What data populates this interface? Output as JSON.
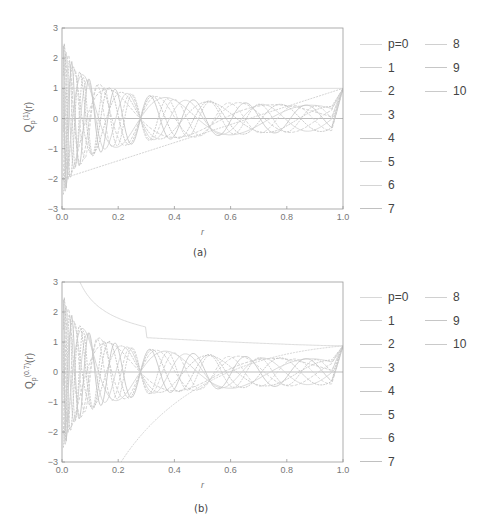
{
  "chart_data": [
    {
      "type": "line",
      "panel": "(a)",
      "title": "",
      "caption": "(a)",
      "xlabel": "r",
      "ylabel": "Q_p^(1)(r)",
      "ylabel_main": "Q",
      "ylabel_sub": "p",
      "ylabel_sup": "(1)",
      "ylabel_arg": "(r)",
      "xlim": [
        0.0,
        1.0
      ],
      "ylim": [
        -3,
        3
      ],
      "xticks": [
        "0.0",
        "0.2",
        "0.4",
        "0.6",
        "0.8",
        "1.0"
      ],
      "yticks": [
        "3",
        "2",
        "1",
        "0",
        "-1",
        "-2",
        "-3"
      ],
      "grid": false,
      "legend_position": "right, two columns",
      "legend": [
        "p=0",
        "1",
        "2",
        "3",
        "4",
        "5",
        "6",
        "7",
        "8",
        "9",
        "10"
      ],
      "alpha": 1,
      "series_description": "Radial functions of order p=0..10; p=0 is constant 1, p=1 rises linearly from about -2 at r=0 to 1 at r=1, higher orders oscillate with decaying amplitude, all reaching 1 at r=1",
      "series": [
        {
          "name": "p=0",
          "x": [
            0.0,
            0.2,
            0.4,
            0.6,
            0.8,
            1.0
          ],
          "values": [
            1.0,
            1.0,
            1.0,
            1.0,
            1.0,
            1.0
          ]
        },
        {
          "name": "1",
          "x": [
            0.0,
            0.2,
            0.4,
            0.6,
            0.8,
            1.0
          ],
          "values": [
            -2.0,
            -1.4,
            -0.8,
            -0.2,
            0.4,
            1.0
          ]
        },
        {
          "name": "2",
          "x": [
            0.0,
            0.2,
            0.4,
            0.6,
            0.8,
            1.0
          ],
          "values": [
            3.0,
            -0.2,
            -0.5,
            -0.5,
            0.0,
            1.0
          ]
        },
        {
          "name": "3",
          "x": [
            0.0,
            0.2,
            0.4,
            0.6,
            0.8,
            1.0
          ],
          "values": [
            -3.0,
            0.7,
            0.1,
            -0.4,
            -0.3,
            1.0
          ]
        },
        {
          "name": "4",
          "x": [
            0.0,
            0.2,
            0.4,
            0.6,
            0.8,
            1.0
          ],
          "values": [
            3.0,
            0.5,
            -0.4,
            0.2,
            -0.3,
            1.0
          ]
        },
        {
          "name": "5",
          "x": [
            0.0,
            0.2,
            0.4,
            0.6,
            0.8,
            1.0
          ],
          "values": [
            -3.0,
            -0.2,
            0.5,
            -0.3,
            0.2,
            1.0
          ]
        },
        {
          "name": "6",
          "x": [
            0.0,
            0.2,
            0.4,
            0.6,
            0.8,
            1.0
          ],
          "values": [
            3.0,
            -0.7,
            0.0,
            0.3,
            -0.3,
            1.0
          ]
        },
        {
          "name": "7",
          "x": [
            0.0,
            0.2,
            0.4,
            0.6,
            0.8,
            1.0
          ],
          "values": [
            -3.0,
            -0.3,
            -0.4,
            0.2,
            0.3,
            1.0
          ]
        },
        {
          "name": "8",
          "x": [
            0.0,
            0.2,
            0.4,
            0.6,
            0.8,
            1.0
          ],
          "values": [
            3.0,
            0.5,
            0.3,
            -0.4,
            0.3,
            1.0
          ]
        },
        {
          "name": "9",
          "x": [
            0.0,
            0.2,
            0.4,
            0.6,
            0.8,
            1.0
          ],
          "values": [
            -3.0,
            0.6,
            0.4,
            -0.3,
            -0.2,
            1.0
          ]
        },
        {
          "name": "10",
          "x": [
            0.0,
            0.2,
            0.4,
            0.6,
            0.8,
            1.0
          ],
          "values": [
            3.0,
            -0.1,
            -0.3,
            0.3,
            -0.4,
            1.0
          ]
        }
      ]
    },
    {
      "type": "line",
      "panel": "(b)",
      "title": "",
      "caption": "(b)",
      "xlabel": "r",
      "ylabel": "Q_p^(0.7)(r)",
      "ylabel_main": "Q",
      "ylabel_sub": "p",
      "ylabel_sup": "(0.7)",
      "ylabel_arg": "(r)",
      "xlim": [
        0.0,
        1.0
      ],
      "ylim": [
        -3,
        3
      ],
      "xticks": [
        "0.0",
        "0.2",
        "0.4",
        "0.6",
        "0.8",
        "1.0"
      ],
      "yticks": [
        "3",
        "2",
        "1",
        "0",
        "-1",
        "-2",
        "-3"
      ],
      "grid": false,
      "legend_position": "right, two columns",
      "legend": [
        "p=0",
        "1",
        "2",
        "3",
        "4",
        "5",
        "6",
        "7",
        "8",
        "9",
        "10"
      ],
      "alpha": 0.7,
      "series_description": "Radial functions of order p=0..10 with alpha=0.7; p=0 decays from above 3 near r=0 to about 0.87 at r=1, higher orders oscillate with decaying amplitude and end near 0.87 at r=1",
      "series": [
        {
          "name": "p=0",
          "x": [
            0.05,
            0.1,
            0.2,
            0.4,
            0.6,
            0.8,
            1.0
          ],
          "values": [
            2.8,
            1.85,
            1.4,
            1.15,
            1.02,
            0.93,
            0.87
          ]
        },
        {
          "name": "1",
          "x": [
            0.05,
            0.1,
            0.2,
            0.4,
            0.6,
            0.8,
            1.0
          ],
          "values": [
            -3.0,
            -2.4,
            -1.2,
            -0.3,
            0.1,
            0.5,
            0.87
          ]
        },
        {
          "name": "2",
          "x": [
            0.05,
            0.1,
            0.2,
            0.4,
            0.6,
            0.8,
            1.0
          ],
          "values": [
            3.0,
            -1.1,
            -0.5,
            -0.5,
            -0.3,
            0.1,
            0.87
          ]
        },
        {
          "name": "3",
          "x": [
            0.05,
            0.1,
            0.2,
            0.4,
            0.6,
            0.8,
            1.0
          ],
          "values": [
            -3.0,
            1.5,
            0.8,
            0.0,
            -0.4,
            -0.2,
            0.87
          ]
        },
        {
          "name": "4",
          "x": [
            0.05,
            0.1,
            0.2,
            0.4,
            0.6,
            0.8,
            1.0
          ],
          "values": [
            3.0,
            0.5,
            0.3,
            -0.4,
            0.2,
            -0.3,
            0.87
          ]
        },
        {
          "name": "5",
          "x": [
            0.05,
            0.1,
            0.2,
            0.4,
            0.6,
            0.8,
            1.0
          ],
          "values": [
            -3.0,
            -0.8,
            -0.3,
            0.5,
            -0.2,
            0.2,
            0.87
          ]
        },
        {
          "name": "6",
          "x": [
            0.05,
            0.1,
            0.2,
            0.4,
            0.6,
            0.8,
            1.0
          ],
          "values": [
            3.0,
            -0.9,
            -0.6,
            0.1,
            0.3,
            -0.3,
            0.87
          ]
        },
        {
          "name": "7",
          "x": [
            0.05,
            0.1,
            0.2,
            0.4,
            0.6,
            0.8,
            1.0
          ],
          "values": [
            -3.0,
            0.4,
            -0.2,
            -0.4,
            0.2,
            0.3,
            0.87
          ]
        },
        {
          "name": "8",
          "x": [
            0.05,
            0.1,
            0.2,
            0.4,
            0.6,
            0.8,
            1.0
          ],
          "values": [
            3.0,
            1.0,
            0.5,
            0.3,
            -0.4,
            0.2,
            0.87
          ]
        },
        {
          "name": "9",
          "x": [
            0.05,
            0.1,
            0.2,
            0.4,
            0.6,
            0.8,
            1.0
          ],
          "values": [
            -3.0,
            0.2,
            0.6,
            0.4,
            -0.3,
            -0.2,
            0.87
          ]
        },
        {
          "name": "10",
          "x": [
            0.05,
            0.1,
            0.2,
            0.4,
            0.6,
            0.8,
            1.0
          ],
          "values": [
            3.0,
            -0.6,
            -0.1,
            -0.3,
            0.3,
            -0.4,
            0.87
          ]
        }
      ]
    }
  ],
  "colors": {
    "axis": "#999999",
    "zero_line": "#aaaaaa",
    "curves": [
      "#d8d8d8",
      "#cfcfcf",
      "#c8c8c8",
      "#d2d2d2",
      "#c4c4c4",
      "#cccccc",
      "#d5d5d5",
      "#c0c0c0",
      "#d0d0d0",
      "#c6c6c6",
      "#cacaca"
    ],
    "legend_line": "#cccccc",
    "text": "#444444"
  }
}
